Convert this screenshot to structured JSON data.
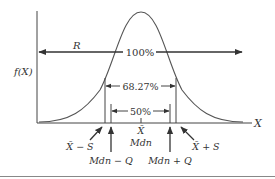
{
  "diagram": {
    "type": "normal-distribution-dispersion",
    "y_axis_label": "f(X)",
    "x_axis_label": "X",
    "range_arrow": {
      "label": "R",
      "percent": "100%"
    },
    "sd_bracket": {
      "percent": "68.27%",
      "left_label": "X̄ − S",
      "right_label": "X̄ + S"
    },
    "quartile_bracket": {
      "percent": "50%",
      "left_label": "Mdn − Q",
      "right_label": "Mdn + Q"
    },
    "center": {
      "mean_label": "X̄",
      "median_label": "Mdn"
    }
  },
  "colors": {
    "line": "#444444",
    "curve": "#555555",
    "text": "#333333",
    "background": "#ffffff"
  }
}
